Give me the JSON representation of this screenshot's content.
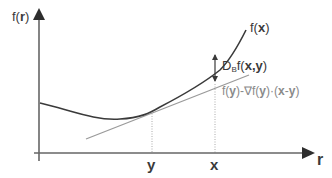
{
  "diagram": {
    "y_axis": {
      "label_prefix": "f(",
      "label_var": "r",
      "label_suffix": ")"
    },
    "x_axis": {
      "label": "r"
    },
    "ticks": [
      {
        "id": "y",
        "label": "y"
      },
      {
        "id": "x",
        "label": "x"
      }
    ],
    "curve": {
      "label_prefix": "f(",
      "label_var": "x",
      "label_suffix": ")"
    },
    "divergence": {
      "label_main": "D",
      "label_sub": "B",
      "label_f": "f(",
      "label_x": "x",
      "label_comma": ",",
      "label_y": "y",
      "label_close": ")"
    },
    "tangent": {
      "p1": "f(",
      "v1": "y",
      "p2": ")-∇f(",
      "v2": "y",
      "p3": ")·(",
      "v3": "x",
      "p4": "-",
      "v4": "y",
      "p5": ")"
    },
    "colors": {
      "axis": "#555555",
      "curve": "#3a3a3a",
      "tangent": "#9a9a9a",
      "dotted": "#aaaaaa",
      "text": "#3a3a3a",
      "tangent_text": "#8a8a8a"
    }
  }
}
